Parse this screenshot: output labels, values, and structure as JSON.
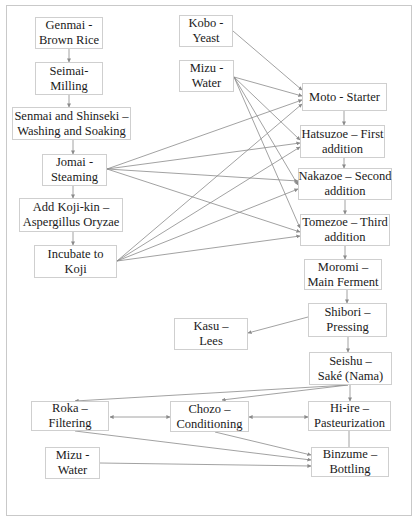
{
  "diagram": {
    "nodes": {
      "genmai": {
        "line1": "Genmai -",
        "line2": "Brown Rice"
      },
      "seimai": {
        "line1": "Seimai-",
        "line2": "Milling"
      },
      "senmai": {
        "line1": "Senmai and Shinseki –",
        "line2": "Washing and Soaking"
      },
      "jomai": {
        "line1": "Jomai -",
        "line2": "Steaming"
      },
      "kojikin": {
        "line1": "Add Koji-kin –",
        "line2": "Aspergillus Oryzae"
      },
      "incubate": {
        "line1": "Incubate to",
        "line2": "Koji"
      },
      "kobo": {
        "line1": "Kobo -",
        "line2": "Yeast"
      },
      "mizu_top": {
        "line1": "Mizu -",
        "line2": "Water"
      },
      "moto": {
        "line1": "Moto - Starter",
        "line2": ""
      },
      "hatsuzoe": {
        "line1": "Hatsuzoe – First",
        "line2": "addition"
      },
      "nakazoe": {
        "line1": "Nakazoe – Second",
        "line2": "addition"
      },
      "tomezoe": {
        "line1": "Tomezoe – Third",
        "line2": "addition"
      },
      "moromi": {
        "line1": "Moromi –",
        "line2": "Main Ferment"
      },
      "shibori": {
        "line1": "Shibori –",
        "line2": "Pressing"
      },
      "kasu": {
        "line1": "Kasu –",
        "line2": "Lees"
      },
      "seishu": {
        "line1": "Seishu –",
        "line2": "Saké (Nama)"
      },
      "roka": {
        "line1": "Roka –",
        "line2": "Filtering"
      },
      "chozo": {
        "line1": "Chozo –",
        "line2": "Conditioning"
      },
      "hiire": {
        "line1": "Hi-ire –",
        "line2": "Pasteurization"
      },
      "mizu_bottom": {
        "line1": "Mizu -",
        "line2": "Water"
      },
      "binzume": {
        "line1": "Binzume –",
        "line2": "Bottling"
      }
    },
    "edges": [
      [
        "genmai",
        "seimai"
      ],
      [
        "seimai",
        "senmai"
      ],
      [
        "senmai",
        "jomai"
      ],
      [
        "jomai",
        "kojikin"
      ],
      [
        "kojikin",
        "incubate"
      ],
      [
        "kobo",
        "moto"
      ],
      [
        "mizu_top",
        "moto"
      ],
      [
        "mizu_top",
        "hatsuzoe"
      ],
      [
        "mizu_top",
        "nakazoe"
      ],
      [
        "mizu_top",
        "tomezoe"
      ],
      [
        "jomai",
        "moto"
      ],
      [
        "jomai",
        "hatsuzoe"
      ],
      [
        "jomai",
        "nakazoe"
      ],
      [
        "jomai",
        "tomezoe"
      ],
      [
        "incubate",
        "moto"
      ],
      [
        "incubate",
        "hatsuzoe"
      ],
      [
        "incubate",
        "nakazoe"
      ],
      [
        "incubate",
        "tomezoe"
      ],
      [
        "moto",
        "hatsuzoe"
      ],
      [
        "hatsuzoe",
        "nakazoe"
      ],
      [
        "nakazoe",
        "tomezoe"
      ],
      [
        "tomezoe",
        "moromi"
      ],
      [
        "moromi",
        "shibori"
      ],
      [
        "shibori",
        "kasu"
      ],
      [
        "shibori",
        "seishu"
      ],
      [
        "seishu",
        "roka"
      ],
      [
        "seishu",
        "chozo"
      ],
      [
        "seishu",
        "hiire"
      ],
      [
        "roka",
        "chozo",
        "bidirectional"
      ],
      [
        "chozo",
        "hiire",
        "bidirectional"
      ],
      [
        "roka",
        "binzume"
      ],
      [
        "chozo",
        "binzume"
      ],
      [
        "hiire",
        "binzume"
      ],
      [
        "mizu_bottom",
        "binzume"
      ]
    ],
    "colors": {
      "line": "#8a8a8a",
      "border": "#cfcfcf",
      "text": "#1a1a1a"
    }
  }
}
